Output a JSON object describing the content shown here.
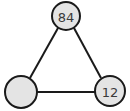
{
  "diagram": {
    "type": "triangle-graph",
    "nodes": [
      {
        "id": "top",
        "label": "84",
        "cx": 66,
        "cy": 16,
        "r": 14
      },
      {
        "id": "bottom-left",
        "label": "",
        "cx": 21,
        "cy": 92,
        "r": 16
      },
      {
        "id": "bottom-right",
        "label": "12",
        "cx": 110,
        "cy": 91,
        "r": 15
      }
    ],
    "edges": [
      {
        "from": "top",
        "to": "bottom-left"
      },
      {
        "from": "top",
        "to": "bottom-right"
      },
      {
        "from": "bottom-left",
        "to": "bottom-right"
      }
    ],
    "colors": {
      "node_fill": "#e4e4e4",
      "stroke": "#1a1a1a",
      "label": "#3a3a3a"
    }
  }
}
